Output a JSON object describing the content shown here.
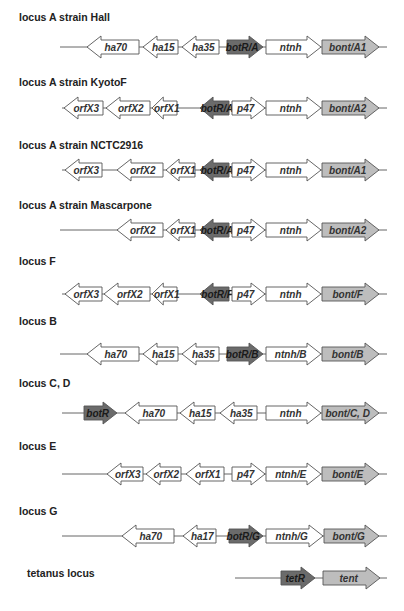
{
  "figure": {
    "colors": {
      "regulator": "#6b6b6b",
      "toxin": "#bdbdbd",
      "other": "#ffffff",
      "stroke": "#555555",
      "line": "#666666"
    },
    "loci": [
      {
        "label": "locus A strain Hall",
        "label_y": 17,
        "y": 47,
        "line": [
          60,
          387
        ],
        "genes": [
          {
            "name": "ha70",
            "x1": 87,
            "x2": 139,
            "dir": "left",
            "type": "other"
          },
          {
            "name": "ha15",
            "x1": 143,
            "x2": 178,
            "dir": "left",
            "type": "other"
          },
          {
            "name": "ha35",
            "x1": 182,
            "x2": 219,
            "dir": "left",
            "type": "other"
          },
          {
            "name": "botR/A",
            "x1": 227,
            "x2": 263,
            "dir": "right",
            "type": "regulator"
          },
          {
            "name": "ntnh",
            "x1": 266,
            "x2": 321,
            "dir": "right",
            "type": "other"
          },
          {
            "name": "bont/A1",
            "x1": 322,
            "x2": 379,
            "dir": "right",
            "type": "toxin"
          }
        ]
      },
      {
        "label": "locus A strain KyotoF",
        "label_y": 82,
        "y": 108,
        "line": [
          62,
          387
        ],
        "genes": [
          {
            "name": "orfX3",
            "x1": 64,
            "x2": 103,
            "dir": "left",
            "type": "other"
          },
          {
            "name": "orfX2",
            "x1": 106,
            "x2": 150,
            "dir": "left",
            "type": "other"
          },
          {
            "name": "orfX1",
            "x1": 152,
            "x2": 177,
            "dir": "left",
            "type": "other"
          },
          {
            "name": "botR/A",
            "x1": 200,
            "x2": 229,
            "dir": "left",
            "type": "regulator"
          },
          {
            "name": "p47",
            "x1": 232,
            "x2": 265,
            "dir": "right",
            "type": "other"
          },
          {
            "name": "ntnh",
            "x1": 266,
            "x2": 321,
            "dir": "right",
            "type": "other"
          },
          {
            "name": "bont/A2",
            "x1": 322,
            "x2": 379,
            "dir": "right",
            "type": "toxin"
          }
        ]
      },
      {
        "label": "locus A strain NCTC2916",
        "label_y": 145,
        "y": 170,
        "line": [
          62,
          387
        ],
        "genes": [
          {
            "name": "orfX3",
            "x1": 65,
            "x2": 102,
            "dir": "left",
            "type": "other"
          },
          {
            "name": "orfX2",
            "x1": 117,
            "x2": 163,
            "dir": "left",
            "type": "other"
          },
          {
            "name": "orfX1",
            "x1": 166,
            "x2": 195,
            "dir": "left",
            "type": "other"
          },
          {
            "name": "botR/A",
            "x1": 200,
            "x2": 229,
            "dir": "left",
            "type": "regulator"
          },
          {
            "name": "p47",
            "x1": 232,
            "x2": 265,
            "dir": "right",
            "type": "other"
          },
          {
            "name": "ntnh",
            "x1": 266,
            "x2": 321,
            "dir": "right",
            "type": "other"
          },
          {
            "name": "bont/A1",
            "x1": 322,
            "x2": 379,
            "dir": "right",
            "type": "toxin"
          }
        ]
      },
      {
        "label": "locus A strain Mascarpone",
        "label_y": 205,
        "y": 230,
        "line": [
          60,
          387
        ],
        "genes": [
          {
            "name": "orfX2",
            "x1": 117,
            "x2": 163,
            "dir": "left",
            "type": "other"
          },
          {
            "name": "orfX1",
            "x1": 166,
            "x2": 195,
            "dir": "left",
            "type": "other"
          },
          {
            "name": "botR/A",
            "x1": 200,
            "x2": 229,
            "dir": "left",
            "type": "regulator"
          },
          {
            "name": "p47",
            "x1": 232,
            "x2": 265,
            "dir": "right",
            "type": "other"
          },
          {
            "name": "ntnh",
            "x1": 266,
            "x2": 321,
            "dir": "right",
            "type": "other"
          },
          {
            "name": "bont/A2",
            "x1": 322,
            "x2": 379,
            "dir": "right",
            "type": "toxin"
          }
        ]
      },
      {
        "label": "locus F",
        "label_y": 261,
        "y": 294,
        "line": [
          62,
          387
        ],
        "genes": [
          {
            "name": "orfX3",
            "x1": 65,
            "x2": 102,
            "dir": "left",
            "type": "other"
          },
          {
            "name": "orfX2",
            "x1": 104,
            "x2": 150,
            "dir": "left",
            "type": "other"
          },
          {
            "name": "orfX1",
            "x1": 152,
            "x2": 177,
            "dir": "left",
            "type": "other"
          },
          {
            "name": "botR/F",
            "x1": 200,
            "x2": 229,
            "dir": "left",
            "type": "regulator"
          },
          {
            "name": "p47",
            "x1": 232,
            "x2": 265,
            "dir": "right",
            "type": "other"
          },
          {
            "name": "ntnh",
            "x1": 266,
            "x2": 321,
            "dir": "right",
            "type": "other"
          },
          {
            "name": "bont/F",
            "x1": 322,
            "x2": 379,
            "dir": "right",
            "type": "toxin"
          }
        ]
      },
      {
        "label": "locus B",
        "label_y": 321,
        "y": 354,
        "line": [
          60,
          387
        ],
        "genes": [
          {
            "name": "ha70",
            "x1": 87,
            "x2": 139,
            "dir": "left",
            "type": "other"
          },
          {
            "name": "ha15",
            "x1": 143,
            "x2": 178,
            "dir": "left",
            "type": "other"
          },
          {
            "name": "ha35",
            "x1": 182,
            "x2": 219,
            "dir": "left",
            "type": "other"
          },
          {
            "name": "botR/B",
            "x1": 227,
            "x2": 263,
            "dir": "right",
            "type": "regulator"
          },
          {
            "name": "ntnh/B",
            "x1": 266,
            "x2": 321,
            "dir": "right",
            "type": "other"
          },
          {
            "name": "bont/B",
            "x1": 322,
            "x2": 379,
            "dir": "right",
            "type": "toxin"
          }
        ]
      },
      {
        "label": "locus C, D",
        "label_y": 383,
        "y": 413,
        "line": [
          62,
          387
        ],
        "genes": [
          {
            "name": "botR",
            "x1": 84,
            "x2": 117,
            "dir": "right",
            "type": "regulator"
          },
          {
            "name": "ha70",
            "x1": 125,
            "x2": 177,
            "dir": "left",
            "type": "other"
          },
          {
            "name": "ha15",
            "x1": 180,
            "x2": 215,
            "dir": "left",
            "type": "other"
          },
          {
            "name": "ha35",
            "x1": 220,
            "x2": 257,
            "dir": "left",
            "type": "other"
          },
          {
            "name": "ntnh",
            "x1": 266,
            "x2": 321,
            "dir": "right",
            "type": "other"
          },
          {
            "name": "bont/C, D",
            "x1": 322,
            "x2": 379,
            "dir": "right",
            "type": "toxin"
          }
        ]
      },
      {
        "label": "locus E",
        "label_y": 446,
        "y": 474,
        "line": [
          62,
          387
        ],
        "genes": [
          {
            "name": "orfX3",
            "x1": 107,
            "x2": 143,
            "dir": "left",
            "type": "other"
          },
          {
            "name": "orfX2",
            "x1": 146,
            "x2": 181,
            "dir": "left",
            "type": "other"
          },
          {
            "name": "orfX1",
            "x1": 186,
            "x2": 224,
            "dir": "left",
            "type": "other"
          },
          {
            "name": "p47",
            "x1": 232,
            "x2": 265,
            "dir": "right",
            "type": "other"
          },
          {
            "name": "ntnh/E",
            "x1": 266,
            "x2": 321,
            "dir": "right",
            "type": "other"
          },
          {
            "name": "bont/E",
            "x1": 322,
            "x2": 379,
            "dir": "right",
            "type": "toxin"
          }
        ]
      },
      {
        "label": "locus G",
        "label_y": 511,
        "y": 536,
        "line": [
          62,
          387
        ],
        "genes": [
          {
            "name": "ha70",
            "x1": 122,
            "x2": 174,
            "dir": "left",
            "type": "other"
          },
          {
            "name": "ha17",
            "x1": 183,
            "x2": 216,
            "dir": "left",
            "type": "other"
          },
          {
            "name": "botR/G",
            "x1": 229,
            "x2": 263,
            "dir": "right",
            "type": "regulator"
          },
          {
            "name": "ntnh/G",
            "x1": 266,
            "x2": 323,
            "dir": "right",
            "type": "other"
          },
          {
            "name": "bont/G",
            "x1": 324,
            "x2": 379,
            "dir": "right",
            "type": "toxin"
          }
        ]
      },
      {
        "label": "tetanus locus",
        "label_y": 573,
        "y": 578,
        "label_x": 27,
        "line": [
          235,
          387
        ],
        "genes": [
          {
            "name": "tetR",
            "x1": 281,
            "x2": 315,
            "dir": "right",
            "type": "regulator"
          },
          {
            "name": "tent",
            "x1": 323,
            "x2": 380,
            "dir": "right",
            "type": "toxin"
          }
        ]
      }
    ]
  }
}
